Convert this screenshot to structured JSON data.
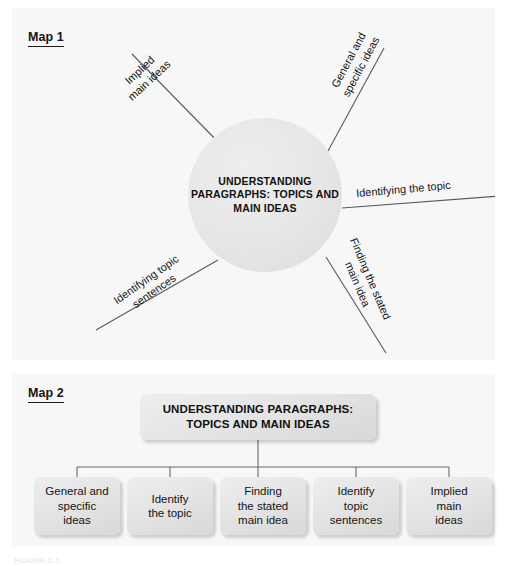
{
  "map1": {
    "heading": "Map 1",
    "hub_text": "UNDERSTANDING\nPARAGRAPHS:\nTOPICS AND\nMAIN IDEAS",
    "spokes": [
      {
        "id": "implied",
        "label": "Implied\nmain ideas"
      },
      {
        "id": "general",
        "label": "General and\nspecific ideas"
      },
      {
        "id": "topic",
        "label": "Identifying the topic"
      },
      {
        "id": "stated",
        "label": "Finding the stated\nmain idea"
      },
      {
        "id": "sentences",
        "label": "Identifying topic\nsentences"
      }
    ]
  },
  "map2": {
    "heading": "Map 2",
    "root_text": "UNDERSTANDING PARAGRAPHS:\nTOPICS AND MAIN IDEAS",
    "leaves": [
      {
        "label": "General and\nspecific\nideas"
      },
      {
        "label": "Identify\nthe topic"
      },
      {
        "label": "Finding\nthe stated\nmain idea"
      },
      {
        "label": "Identify\ntopic\nsentences"
      },
      {
        "label": "Implied\nmain\nideas"
      }
    ]
  },
  "figure": {
    "caption": "FIGURE 1.1"
  },
  "colors": {
    "panel_background": "#f7f7f7",
    "page_background": "#ffffff",
    "node_fill": "#e4e4e4",
    "line": "#5a5a5a",
    "text": "#141414"
  }
}
